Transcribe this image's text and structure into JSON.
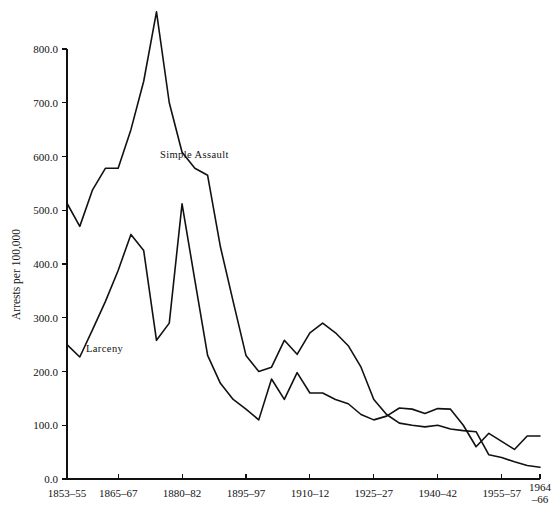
{
  "chart_data": {
    "type": "line",
    "title": "",
    "xlabel": "",
    "ylabel": "Arrests per 100,000",
    "ylim": [
      0,
      800
    ],
    "yticks": [
      0,
      100,
      200,
      300,
      400,
      500,
      600,
      700,
      800
    ],
    "ytick_labels": [
      "0.0",
      "100.0",
      "200.0",
      "300.0",
      "400.0",
      "500.0",
      "600.0",
      "700.0",
      "800.0"
    ],
    "grid": false,
    "legend": "inline-annotations",
    "xtick_labels": [
      "1853–55",
      "1865–67",
      "1880–82",
      "1895–97",
      "1910–12",
      "1925–27",
      "1940–42",
      "1955–57",
      "1964\n–66"
    ],
    "xtick_positions": [
      0,
      4,
      9,
      14,
      19,
      24,
      29,
      34,
      37
    ],
    "x": [
      0,
      1,
      2,
      3,
      4,
      5,
      6,
      7,
      8,
      9,
      10,
      11,
      12,
      13,
      14,
      15,
      16,
      17,
      18,
      19,
      20,
      21,
      22,
      23,
      24,
      25,
      26,
      27,
      28,
      29,
      30,
      31,
      32,
      33,
      34,
      35,
      36,
      37
    ],
    "series": [
      {
        "name": "Simple Assault",
        "label_position": {
          "x": 160,
          "y": 158
        },
        "values": [
          513,
          470,
          538,
          578,
          578,
          650,
          740,
          869,
          700,
          608,
          578,
          565,
          432,
          330,
          230,
          200,
          208,
          258,
          232,
          272,
          290,
          272,
          248,
          208,
          148,
          120,
          104,
          100,
          97,
          100,
          93,
          90,
          88,
          45,
          40,
          32,
          25,
          22
        ]
      },
      {
        "name": "Larceny",
        "label_position": {
          "x": 86,
          "y": 352
        },
        "values": [
          250,
          227,
          278,
          330,
          388,
          455,
          425,
          258,
          290,
          512,
          370,
          230,
          178,
          148,
          130,
          110,
          186,
          148,
          198,
          160,
          160,
          148,
          140,
          120,
          110,
          117,
          132,
          130,
          122,
          131,
          130,
          100,
          60,
          85,
          70,
          55,
          80,
          80
        ]
      }
    ]
  },
  "axis": {
    "x_start_px": 67,
    "x_end_px": 540,
    "y_zero_px": 479,
    "y_top_px": 49
  }
}
